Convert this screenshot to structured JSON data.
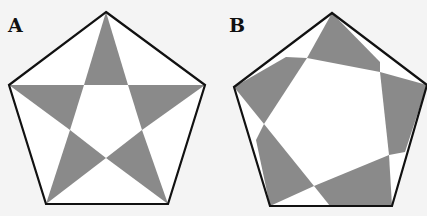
{
  "panels": [
    {
      "label": "A",
      "description": "Regular pentagon with inscribed five-pointed star (pentagram); star points shaded gray"
    },
    {
      "label": "B",
      "description": "Regular pentagon with rotated inner pentagon; overlapping regions shaded gray"
    }
  ],
  "colors": {
    "background": "#f4f4f4",
    "fill": "#8a8a8a",
    "outline": "#111111",
    "white": "#ffffff"
  }
}
